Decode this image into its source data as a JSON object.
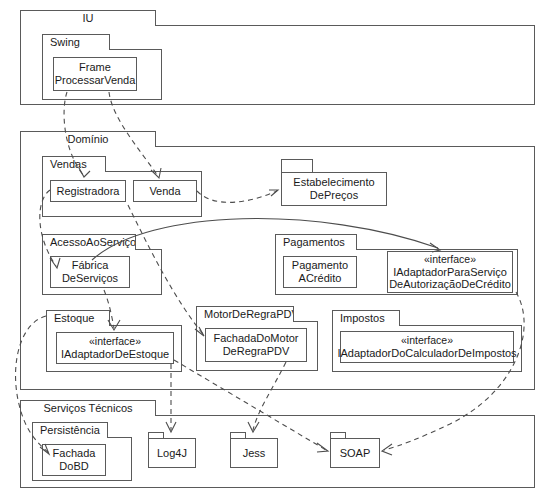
{
  "diagram": {
    "type": "uml-package-diagram",
    "title": "",
    "stereotype_label": "«interface»"
  },
  "packages": {
    "iu": {
      "name": "IU"
    },
    "swing": {
      "name": "Swing"
    },
    "dominio": {
      "name": "Domínio"
    },
    "vendas": {
      "name": "Vendas"
    },
    "acesso_ao_servico": {
      "name": "AcessoAoServiço"
    },
    "estoque": {
      "name": "Estoque"
    },
    "motor_de_regra_pdv": {
      "name": "MotorDeRegraPDV"
    },
    "impostos": {
      "name": "Impostos"
    },
    "pagamentos": {
      "name": "Pagamentos"
    },
    "estabelecimento": {
      "name": ""
    },
    "servicos_tecnicos": {
      "name": "Serviços Técnicos"
    },
    "persistencia": {
      "name": "Persistência"
    }
  },
  "classes": {
    "frame_processar_venda": {
      "line1": "Frame",
      "line2": "ProcessarVenda"
    },
    "registradora": {
      "line1": "Registradora",
      "line2": ""
    },
    "venda": {
      "line1": "Venda",
      "line2": ""
    },
    "estabelecimento_de_precos": {
      "line1": "Estabelecimento",
      "line2": "DePreços"
    },
    "fabrica_de_servicos": {
      "line1": "Fábrica",
      "line2": "DeServiços"
    },
    "pagamento_a_credito": {
      "line1": "Pagamento",
      "line2": "ACrédito"
    },
    "iadaptador_para_servico_autorizacao": {
      "stereotype": "«interface»",
      "line1": "IAdaptadorParaServiço",
      "line2": "DeAutorizaçãoDeCrédito"
    },
    "iadaptador_de_estoque": {
      "stereotype": "«interface»",
      "line1": "IAdaptadorDeEstoque",
      "line2": ""
    },
    "fachada_do_motor_de_regra_pdv": {
      "line1": "FachadaDoMotor",
      "line2": "DeRegraPDV"
    },
    "iadaptador_do_calculador_de_impostos": {
      "stereotype": "«interface»",
      "line1": "IAdaptadorDoCalculadorDeImpostos",
      "line2": ""
    },
    "fachada_do_bd": {
      "line1": "Fachada",
      "line2": "DoBD"
    },
    "log4j": {
      "line1": "Log4J",
      "line2": ""
    },
    "jess": {
      "line1": "Jess",
      "line2": ""
    },
    "soap": {
      "line1": "SOAP",
      "line2": ""
    }
  },
  "dependencies": [
    {
      "from": "frame_processar_venda",
      "to": "registradora",
      "style": "dashed"
    },
    {
      "from": "frame_processar_venda",
      "to": "venda",
      "style": "dashed"
    },
    {
      "from": "venda",
      "to": "estabelecimento_de_precos",
      "style": "dashed"
    },
    {
      "from": "registradora",
      "to": "fabrica_de_servicos",
      "style": "dashed"
    },
    {
      "from": "fabrica_de_servicos",
      "to": "iadaptador_para_servico_autorizacao",
      "style": "solid"
    },
    {
      "from": "fabrica_de_servicos",
      "to": "iadaptador_de_estoque",
      "style": "dashed"
    },
    {
      "from": "registradora",
      "to": "fachada_do_motor_de_regra_pdv",
      "style": "dashed"
    },
    {
      "from": "iadaptador_de_estoque",
      "to": "fachada_do_bd",
      "style": "dashed"
    },
    {
      "from": "iadaptador_de_estoque",
      "to": "log4j",
      "style": "dashed"
    },
    {
      "from": "iadaptador_de_estoque",
      "to": "soap",
      "style": "dashed"
    },
    {
      "from": "fachada_do_motor_de_regra_pdv",
      "to": "jess",
      "style": "dashed"
    },
    {
      "from": "iadaptador_para_servico_autorizacao",
      "to": "soap",
      "style": "dashed"
    }
  ],
  "colors": {
    "stroke": "#5a5a5a",
    "connector": "#4d4d4d",
    "text": "#1a1a1a",
    "background": "#ffffff"
  }
}
